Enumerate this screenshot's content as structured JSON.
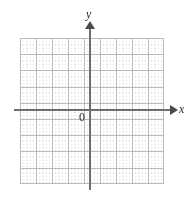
{
  "figure": {
    "kind": "blank-cartesian-coordinate-grid",
    "width": 192,
    "height": 202,
    "background_color": "#ffffff"
  },
  "axes": {
    "x": {
      "label": "x",
      "color": "#6f6f6f",
      "arrow_color": "#4a4a4a",
      "arrow_direction": "right"
    },
    "y": {
      "label": "y",
      "color": "#6f6f6f",
      "arrow_color": "#4a4a4a",
      "arrow_direction": "up"
    },
    "origin": {
      "label": "0",
      "color": "#2b2b2b"
    }
  },
  "grid": {
    "minor_color": "#bfbfbf",
    "major_color": "#b0b0b0",
    "major_cell_px": 16,
    "minor_cell_px": 3.2,
    "columns": 9,
    "rows": 9,
    "left_px": 20,
    "top_px": 38,
    "width_px": 144,
    "height_px": 146,
    "style": "dotted-graph-paper"
  },
  "chart_data": {
    "type": "scatter",
    "title": "",
    "subtitle": "",
    "xlabel": "x",
    "ylabel": "y",
    "series": [
      {
        "name": "",
        "x": [],
        "y": []
      }
    ],
    "xlim": [
      -4.5,
      4.5
    ],
    "ylim": [
      -4.5,
      4.5
    ],
    "xticks": [],
    "yticks": [],
    "xtick_labels": [],
    "ytick_labels": [],
    "annotations": [
      "0"
    ],
    "grid": true,
    "legend": null,
    "legend_position": "none",
    "note": "Empty coordinate plane with no plotted data; only axes, origin label and graph-paper grid are drawn."
  }
}
